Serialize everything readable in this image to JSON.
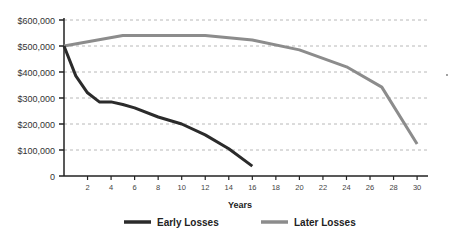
{
  "chart_data": {
    "type": "line",
    "title": "",
    "xlabel": "Years",
    "ylabel": "",
    "xlim": [
      0,
      31
    ],
    "ylim": [
      0,
      600000
    ],
    "grid": true,
    "legend_position": "bottom",
    "y_ticks": [
      {
        "value": 0,
        "label": "0"
      },
      {
        "value": 100000,
        "label": "$100,000"
      },
      {
        "value": 200000,
        "label": "$200,000"
      },
      {
        "value": 300000,
        "label": "$300,000"
      },
      {
        "value": 400000,
        "label": "$400,000"
      },
      {
        "value": 500000,
        "label": "$500,000"
      },
      {
        "value": 600000,
        "label": "$600,000"
      }
    ],
    "x_ticks": [
      2,
      4,
      6,
      8,
      10,
      12,
      14,
      16,
      18,
      20,
      22,
      24,
      26,
      28,
      30
    ],
    "series": [
      {
        "name": "Early Losses",
        "color": "#2b2b2b",
        "x": [
          0,
          1,
          2,
          3,
          4,
          5,
          6,
          8,
          10,
          12,
          14,
          16
        ],
        "values": [
          500000,
          385000,
          320000,
          285000,
          285000,
          275000,
          262000,
          227000,
          200000,
          158000,
          105000,
          38000
        ]
      },
      {
        "name": "Later Losses",
        "color": "#8c8c8c",
        "x": [
          0,
          5,
          12,
          16,
          20,
          24,
          27,
          30
        ],
        "values": [
          500000,
          540000,
          540000,
          523000,
          485000,
          420000,
          342000,
          123000
        ]
      }
    ]
  }
}
